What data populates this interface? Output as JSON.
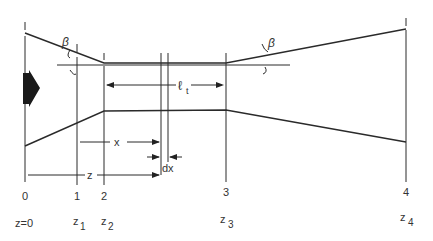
{
  "labels": {
    "beta_left": "β",
    "beta_right": "β",
    "throat_length": "ℓ",
    "throat_length_sub": "t",
    "x": "x",
    "dx": "dx",
    "z": "z"
  },
  "stations": [
    {
      "index": "0",
      "z_label": "z=0",
      "z_sub": ""
    },
    {
      "index": "1",
      "z_label": "z",
      "z_sub": "1"
    },
    {
      "index": "2",
      "z_label": "z",
      "z_sub": "2"
    },
    {
      "index": "3",
      "z_label": "z",
      "z_sub": "3"
    },
    {
      "index": "4",
      "z_label": "z",
      "z_sub": "4"
    }
  ],
  "flow_arrow": "flow-direction-arrow",
  "colors": {
    "line": "#2a2a2a",
    "text": "#333333",
    "background": "#ffffff"
  }
}
